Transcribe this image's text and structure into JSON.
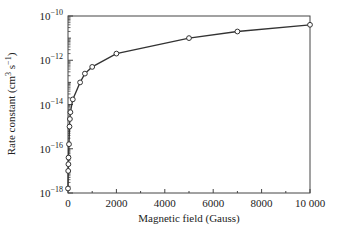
{
  "chart_data": {
    "type": "line",
    "title": "",
    "xlabel": "Magnetic field (Gauss)",
    "ylabel": "Rate constant (cm³ s⁻¹)",
    "ylabel_parts": {
      "main": "Rate constant (cm",
      "sup1": "3",
      "mid": " s",
      "sup2": "−1",
      "end": ")"
    },
    "xscale": "linear",
    "yscale": "log",
    "xlim": [
      0,
      10000
    ],
    "ylim": [
      1e-18,
      1e-10
    ],
    "grid": false,
    "legend": null,
    "marker": "open-circle",
    "xticks": [
      0,
      2000,
      4000,
      6000,
      8000,
      10000
    ],
    "xtick_labels": [
      "0",
      "2000",
      "4000",
      "6000",
      "8000",
      "10 000"
    ],
    "yticks_exp": [
      -10,
      -12,
      -14,
      -16,
      -18
    ],
    "ytick_labels": [
      {
        "base": "10",
        "exp": "−10"
      },
      {
        "base": "10",
        "exp": "−12"
      },
      {
        "base": "10",
        "exp": "−14"
      },
      {
        "base": "10",
        "exp": "−16"
      },
      {
        "base": "10",
        "exp": "−18"
      }
    ],
    "series": [
      {
        "name": "rate constant",
        "x": [
          0,
          10,
          15,
          20,
          40,
          60,
          80,
          100,
          200,
          500,
          700,
          1000,
          2000,
          5000,
          7000,
          10000
        ],
        "y": [
          1.6e-18,
          1e-17,
          2e-17,
          4e-17,
          1.6e-16,
          1e-15,
          2.2e-15,
          4.5e-15,
          1.7e-14,
          1e-13,
          2.5e-13,
          5e-13,
          2e-12,
          1e-11,
          2e-11,
          4e-11
        ]
      }
    ]
  },
  "colors": {
    "line": "#333333",
    "axis": "#444444",
    "marker_fill": "#ffffff"
  }
}
